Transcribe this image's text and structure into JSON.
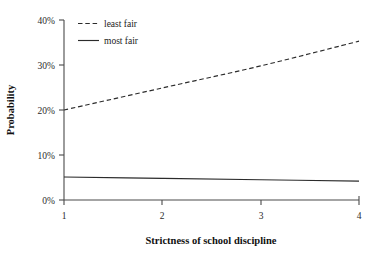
{
  "chart_data": {
    "type": "line",
    "title": "",
    "xlabel": "Strictness of school discipline",
    "ylabel": "Probability",
    "x": [
      1,
      2,
      3,
      4
    ],
    "xlim": [
      1,
      4
    ],
    "ylim": [
      0,
      40
    ],
    "xticks": [
      "1",
      "2",
      "3",
      "4"
    ],
    "yticks": [
      "0%",
      "10%",
      "20%",
      "30%",
      "40%"
    ],
    "ytick_values": [
      0,
      10,
      20,
      30,
      40
    ],
    "grid": false,
    "legend_position": "top-left",
    "series": [
      {
        "name": "least fair",
        "style": "dashed",
        "color": "#2b2b2b",
        "values": [
          20.0,
          24.9,
          29.8,
          35.3
        ]
      },
      {
        "name": "most fair",
        "style": "solid",
        "color": "#2b2b2b",
        "values": [
          5.1,
          4.8,
          4.5,
          4.2
        ]
      }
    ]
  },
  "axes": {
    "y_title": "Probability",
    "x_title": "Strictness of school discipline"
  },
  "legend": {
    "entries": [
      {
        "label": "least fair",
        "style": "dashed"
      },
      {
        "label": "most fair",
        "style": "solid"
      }
    ]
  },
  "ticks": {
    "y": [
      "40%",
      "30%",
      "20%",
      "10%",
      "0%"
    ],
    "x": [
      "1",
      "2",
      "3",
      "4"
    ]
  },
  "colors": {
    "axis": "#4a4a4a",
    "line": "#2b2b2b",
    "text": "#1a1a1a",
    "background": "#ffffff"
  }
}
